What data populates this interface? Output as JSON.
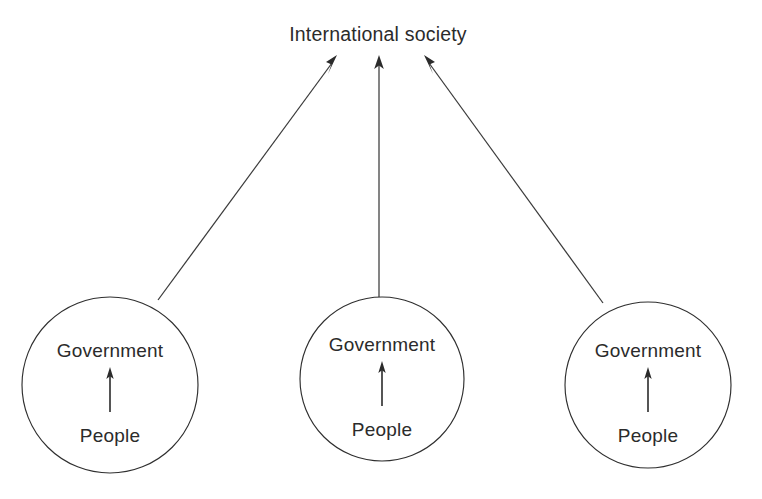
{
  "diagram": {
    "title": "International society",
    "type": "pluralist international society diagram",
    "top_node": {
      "label": "International society",
      "center_x": 378,
      "center_y": 34
    },
    "states": [
      {
        "id": "state-1",
        "government_label": "Government",
        "people_label": "People",
        "center_x": 110,
        "center_y": 385,
        "radius": 88,
        "inner_arrow": {
          "from_y": 412,
          "to_y": 368,
          "x": 110
        },
        "government_text_y": 357,
        "people_text_y": 442
      },
      {
        "id": "state-2",
        "government_label": "Government",
        "people_label": "People",
        "center_x": 382,
        "center_y": 379,
        "radius": 82,
        "inner_arrow": {
          "from_y": 406,
          "to_y": 362,
          "x": 382
        },
        "government_text_y": 351,
        "people_text_y": 436
      },
      {
        "id": "state-3",
        "government_label": "Government",
        "people_label": "People",
        "center_x": 648,
        "center_y": 385,
        "radius": 83,
        "inner_arrow": {
          "from_y": 412,
          "to_y": 368,
          "x": 648
        },
        "government_text_y": 357,
        "people_text_y": 442
      }
    ],
    "connectors": [
      {
        "id": "connector-left",
        "from_x": 158,
        "from_y": 300,
        "to_x": 337,
        "to_y": 56
      },
      {
        "id": "connector-middle",
        "from_x": 379,
        "from_y": 297,
        "to_x": 379,
        "to_y": 57
      },
      {
        "id": "connector-right",
        "from_x": 603,
        "from_y": 303,
        "to_x": 424,
        "to_y": 57
      }
    ],
    "colors": {
      "background": "#ffffff",
      "stroke": "#2f2f2f",
      "text": "#2b2b2b"
    }
  }
}
